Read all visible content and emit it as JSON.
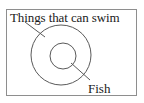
{
  "diagram": {
    "type": "set-diagram",
    "title": "",
    "frame": {
      "border_color": "#8e8e8e",
      "background": "#ffffff"
    },
    "stroke_color": "#5a5a5a",
    "sets": [
      {
        "id": "outer",
        "label": "Things that can swim",
        "shape": "circle",
        "cx": 61,
        "cy": 55,
        "r": 30,
        "leader_line": {
          "x1": 25,
          "y1": 22,
          "x2": 45,
          "y2": 37
        }
      },
      {
        "id": "inner",
        "label": "Fish",
        "shape": "circle",
        "cx": 63,
        "cy": 56,
        "r": 13,
        "leader_line": {
          "x1": 71,
          "y1": 63,
          "x2": 90,
          "y2": 80
        }
      }
    ]
  }
}
